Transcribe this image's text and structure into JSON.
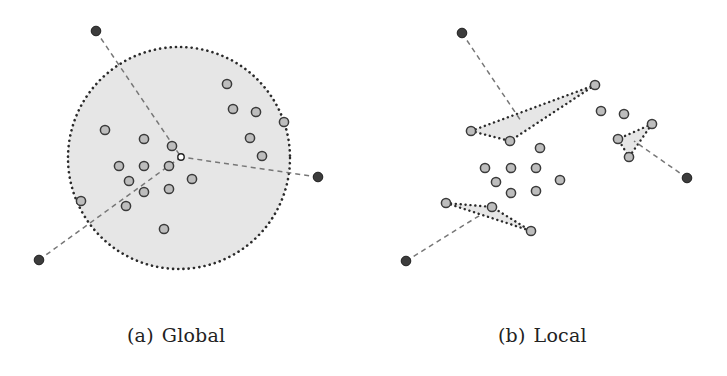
{
  "figure": {
    "panels": [
      {
        "id": "a",
        "caption_label": "(a)",
        "caption_text": "Global",
        "region": {
          "type": "circle",
          "cx": 179,
          "cy": 158,
          "r": 111
        },
        "center_node": {
          "x": 181,
          "y": 157
        },
        "outer_nodes": [
          {
            "x": 96,
            "y": 31
          },
          {
            "x": 318,
            "y": 177
          },
          {
            "x": 39,
            "y": 260
          }
        ],
        "dashed_links": [
          {
            "from": [
              96,
              31
            ],
            "to": [
              181,
              157
            ]
          },
          {
            "from": [
              318,
              177
            ],
            "to": [
              181,
              157
            ]
          },
          {
            "from": [
              39,
              260
            ],
            "to": [
              181,
              157
            ]
          }
        ],
        "inner_nodes": [
          {
            "x": 105,
            "y": 130
          },
          {
            "x": 144,
            "y": 139
          },
          {
            "x": 172,
            "y": 146
          },
          {
            "x": 119,
            "y": 166
          },
          {
            "x": 144,
            "y": 166
          },
          {
            "x": 169,
            "y": 166
          },
          {
            "x": 129,
            "y": 181
          },
          {
            "x": 192,
            "y": 179
          },
          {
            "x": 144,
            "y": 192
          },
          {
            "x": 169,
            "y": 189
          },
          {
            "x": 81,
            "y": 201
          },
          {
            "x": 126,
            "y": 206
          },
          {
            "x": 164,
            "y": 229
          },
          {
            "x": 227,
            "y": 84
          },
          {
            "x": 233,
            "y": 109
          },
          {
            "x": 256,
            "y": 112
          },
          {
            "x": 284,
            "y": 122
          },
          {
            "x": 250,
            "y": 138
          },
          {
            "x": 262,
            "y": 156
          }
        ]
      },
      {
        "id": "b",
        "caption_label": "(b)",
        "caption_text": "Local",
        "regions": [
          {
            "type": "triangle",
            "points": [
              [
                471,
                131
              ],
              [
                595,
                85
              ],
              [
                510,
                141
              ]
            ]
          },
          {
            "type": "triangle",
            "points": [
              [
                652,
                124
              ],
              [
                618,
                139
              ],
              [
                629,
                157
              ]
            ]
          },
          {
            "type": "triangle",
            "points": [
              [
                446,
                203
              ],
              [
                492,
                207
              ],
              [
                531,
                231
              ]
            ]
          }
        ],
        "outer_nodes": [
          {
            "x": 462,
            "y": 33
          },
          {
            "x": 687,
            "y": 178
          },
          {
            "x": 406,
            "y": 261
          }
        ],
        "dashed_links": [
          {
            "from": [
              462,
              33
            ],
            "to": [
              521,
              121
            ]
          },
          {
            "from": [
              687,
              178
            ],
            "to": [
              634,
              141
            ]
          },
          {
            "from": [
              406,
              261
            ],
            "to": [
              482,
              214
            ]
          }
        ],
        "inner_nodes": [
          {
            "x": 471,
            "y": 131
          },
          {
            "x": 595,
            "y": 85
          },
          {
            "x": 510,
            "y": 141
          },
          {
            "x": 540,
            "y": 148
          },
          {
            "x": 485,
            "y": 168
          },
          {
            "x": 511,
            "y": 168
          },
          {
            "x": 536,
            "y": 168
          },
          {
            "x": 496,
            "y": 182
          },
          {
            "x": 560,
            "y": 180
          },
          {
            "x": 511,
            "y": 193
          },
          {
            "x": 536,
            "y": 191
          },
          {
            "x": 601,
            "y": 111
          },
          {
            "x": 624,
            "y": 114
          },
          {
            "x": 652,
            "y": 124
          },
          {
            "x": 618,
            "y": 139
          },
          {
            "x": 629,
            "y": 157
          },
          {
            "x": 446,
            "y": 203
          },
          {
            "x": 492,
            "y": 207
          },
          {
            "x": 531,
            "y": 231
          }
        ]
      }
    ],
    "colors": {
      "region_fill": "#e6e6e6",
      "region_border": "#2a2a2a",
      "inner_node_fill": "#bdbdbd",
      "inner_node_stroke": "#3a3a3a",
      "outer_node_fill": "#3c3c3c",
      "outer_node_stroke": "#1e1e1e",
      "center_node_fill": "#ffffff",
      "dashed_link": "#777777"
    }
  }
}
